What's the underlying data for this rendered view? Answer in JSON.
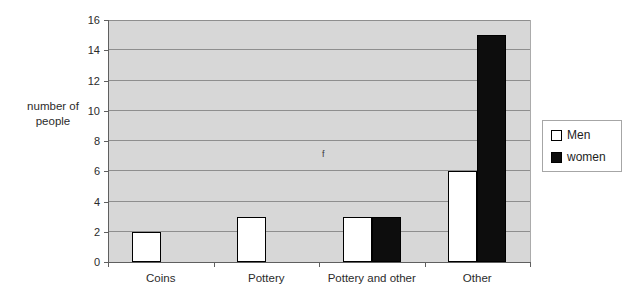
{
  "figure": {
    "background": "#ffffff",
    "annotation_f": "f"
  },
  "chart_data": {
    "type": "bar",
    "title": "",
    "categories": [
      "Coins",
      "Pottery",
      "Pottery and other",
      "Other"
    ],
    "series": [
      {
        "name": "Men",
        "color": "#ffffff",
        "values": [
          2,
          3,
          3,
          6
        ]
      },
      {
        "name": "women",
        "color": "#0d0d0d",
        "values": [
          0,
          0,
          3,
          15
        ]
      }
    ],
    "xlabel": "",
    "ylabel": "number of people",
    "ylabel_lines": [
      "number of",
      "people"
    ],
    "ylim": [
      0,
      16
    ],
    "ytick_step": 2,
    "yticks": [
      0,
      2,
      4,
      6,
      8,
      10,
      12,
      14,
      16
    ],
    "grid": "horizontal",
    "legend_position": "right",
    "plot_background": "#d7d7d7",
    "gridline_color": "#8e8e8e",
    "axis_color": "#5f5f5f"
  }
}
